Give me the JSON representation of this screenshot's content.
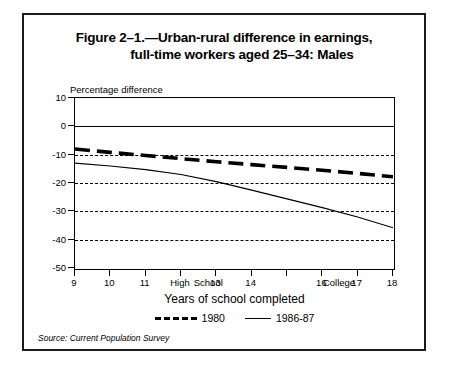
{
  "figure": {
    "title_line1": "Figure 2–1.—Urban-rural difference in earnings,",
    "title_line2": "full-time workers aged 25–34: Males",
    "source": "Source: Current Population Survey"
  },
  "chart_data": {
    "type": "line",
    "title": "Figure 2–1.—Urban-rural difference in earnings, full-time workers aged 25–34: Males",
    "ylabel": "Percentage difference",
    "xlabel": "Years of school completed",
    "ylim": [
      -50,
      10
    ],
    "xlim": [
      9,
      18
    ],
    "yticks": [
      10,
      0,
      -10,
      -20,
      -30,
      -40,
      -50
    ],
    "ytick_labels": [
      "10",
      "0",
      "-10",
      "-20",
      "-30",
      "-40",
      "-50"
    ],
    "xticks": [
      9,
      10,
      11,
      12,
      12.8,
      13,
      14,
      16,
      16.5,
      17,
      18
    ],
    "xtick_labels": [
      "9",
      "10",
      "11",
      "High",
      "School",
      "13",
      "14",
      "16",
      "College",
      "17",
      "18"
    ],
    "grid": "horizontal-dashed",
    "gridlines": [
      0,
      -10,
      -20,
      -30,
      -40
    ],
    "legend_position": "below-axis",
    "x": [
      9,
      10,
      11,
      12,
      13,
      14,
      15,
      16,
      17,
      18
    ],
    "series": [
      {
        "name": "1980",
        "style": "thick-dashed",
        "values": [
          -8.0,
          -9.2,
          -10.3,
          -11.4,
          -12.5,
          -13.5,
          -14.5,
          -15.5,
          -16.6,
          -17.8
        ]
      },
      {
        "name": "1986-87",
        "style": "thin-solid",
        "values": [
          -13.0,
          -14.0,
          -15.3,
          -17.0,
          -19.5,
          -22.5,
          -25.6,
          -28.7,
          -32.0,
          -35.8
        ]
      }
    ]
  }
}
